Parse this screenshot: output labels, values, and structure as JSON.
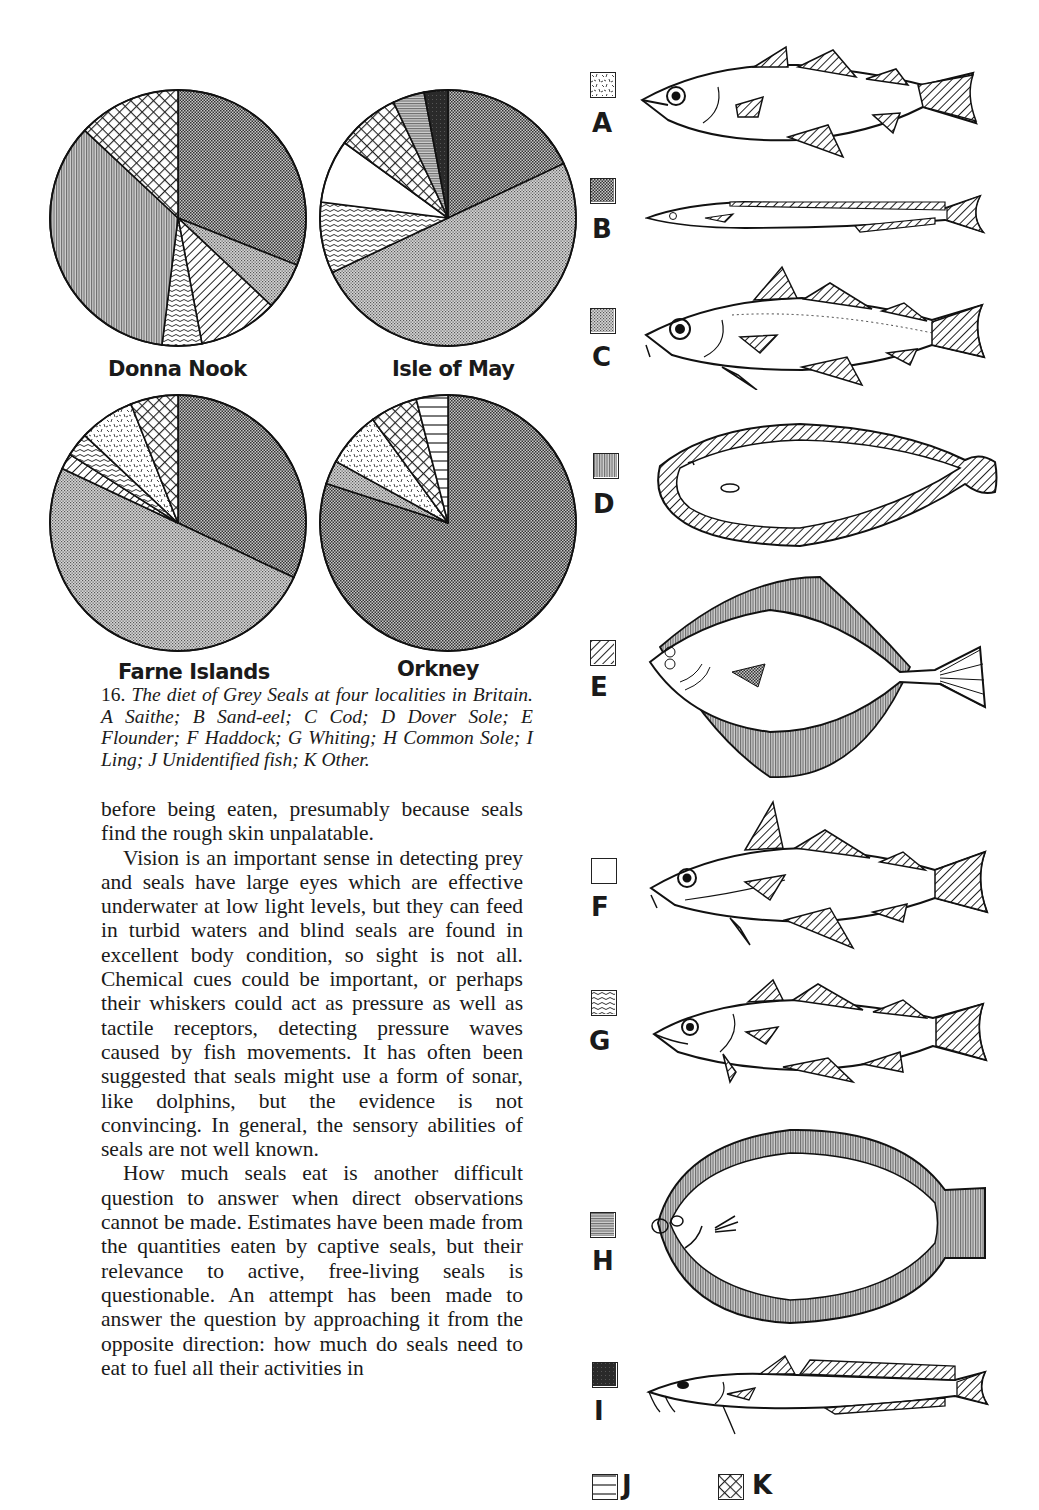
{
  "chart_data": [
    {
      "type": "pie",
      "title": "Donna Nook",
      "start": "12 o'clock, clockwise",
      "slices": [
        {
          "key": "B",
          "label": "Sand-eel",
          "value": 31
        },
        {
          "key": "C",
          "label": "Cod",
          "value": 6
        },
        {
          "key": "E",
          "label": "Flounder",
          "value": 10
        },
        {
          "key": "G",
          "label": "Whiting",
          "value": 5
        },
        {
          "key": "D",
          "label": "Dover Sole",
          "value": 35
        },
        {
          "key": "K",
          "label": "Other",
          "value": 13
        }
      ]
    },
    {
      "type": "pie",
      "title": "Isle of May",
      "start": "12 o'clock, clockwise",
      "slices": [
        {
          "key": "B",
          "label": "Sand-eel",
          "value": 18
        },
        {
          "key": "C",
          "label": "Cod",
          "value": 50
        },
        {
          "key": "G",
          "label": "Whiting",
          "value": 9
        },
        {
          "key": "F",
          "label": "Haddock",
          "value": 8
        },
        {
          "key": "K",
          "label": "Other",
          "value": 8
        },
        {
          "key": "H",
          "label": "Common Sole",
          "value": 4
        },
        {
          "key": "I",
          "label": "Ling",
          "value": 3
        }
      ]
    },
    {
      "type": "pie",
      "title": "Farne Islands",
      "start": "12 o'clock, clockwise",
      "slices": [
        {
          "key": "B",
          "label": "Sand-eel",
          "value": 32
        },
        {
          "key": "C",
          "label": "Cod",
          "value": 50
        },
        {
          "key": "E",
          "label": "Flounder",
          "value": 2
        },
        {
          "key": "G",
          "label": "Whiting",
          "value": 3
        },
        {
          "key": "A",
          "label": "Saithe",
          "value": 7
        },
        {
          "key": "K",
          "label": "Other",
          "value": 6
        }
      ]
    },
    {
      "type": "pie",
      "title": "Orkney",
      "start": "12 o'clock, clockwise",
      "slices": [
        {
          "key": "B",
          "label": "Sand-eel",
          "value": 80
        },
        {
          "key": "C",
          "label": "Cod",
          "value": 3
        },
        {
          "key": "A",
          "label": "Saithe",
          "value": 7
        },
        {
          "key": "K",
          "label": "Other",
          "value": 6
        },
        {
          "key": "J",
          "label": "Unidentified fish",
          "value": 4
        }
      ]
    }
  ],
  "legend": [
    {
      "key": "A",
      "name": "Saithe",
      "pattern": "speckle"
    },
    {
      "key": "B",
      "name": "Sand-eel",
      "pattern": "dense-check"
    },
    {
      "key": "C",
      "name": "Cod",
      "pattern": "fine-check"
    },
    {
      "key": "D",
      "name": "Dover Sole",
      "pattern": "vertical"
    },
    {
      "key": "E",
      "name": "Flounder",
      "pattern": "diagonal"
    },
    {
      "key": "F",
      "name": "Haddock",
      "pattern": "blank"
    },
    {
      "key": "G",
      "name": "Whiting",
      "pattern": "wavy"
    },
    {
      "key": "H",
      "name": "Common Sole",
      "pattern": "horizontal-fine"
    },
    {
      "key": "I",
      "name": "Ling",
      "pattern": "solid-dark"
    },
    {
      "key": "J",
      "name": "Unidentified fish",
      "pattern": "horizontal"
    },
    {
      "key": "K",
      "name": "Other",
      "pattern": "crosshatch"
    }
  ],
  "caption": {
    "number": "16.",
    "text": "The diet of Grey Seals at four localities in Britain. A Saithe; B Sand-eel; C Cod; D Dover Sole; E Flounder; F Haddock; G Whiting; H Common Sole; I Ling; J Unidentified fish; K Other."
  },
  "body": {
    "paragraphs": [
      "before being eaten, presumably because seals find the rough skin unpalatable.",
      "Vision is an important sense in detecting prey and seals have large eyes which are effective underwater at low light levels, but they can feed in turbid waters and blind seals are found in excellent body condition, so sight is not all. Chemical cues could be important, or perhaps their whiskers could act as pressure as well as tactile receptors, detecting pressure waves caused by fish movements. It has often been suggested that seals might use a form of sonar, like dolphins, but the evidence is not convincing. In general, the sensory abilities of seals are not well known.",
      "How much seals eat is another difficult question to answer when direct observations cannot be made. Estimates have been made from the quantities eaten by captive seals, but their relevance to active, free-living seals is questionable. An attempt has been made to answer the question by approaching it from the opposite direction: how much do seals need to eat to fuel all their activities in"
    ]
  }
}
